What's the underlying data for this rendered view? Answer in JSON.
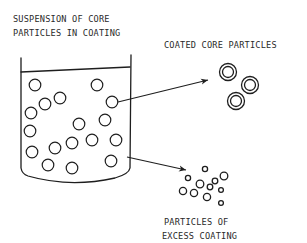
{
  "diagram": {
    "labels": {
      "suspension_line1": "SUSPENSION OF CORE",
      "suspension_line2": "PARTICLES IN COATING",
      "coated": "COATED CORE PARTICLES",
      "excess_line1": "PARTICLES OF",
      "excess_line2": "EXCESS COATING"
    },
    "colors": {
      "ink": "#1e1e1e",
      "background": "#ffffff"
    },
    "container": "beaker-with-suspension",
    "core_particle_count": 17,
    "coated_particle_count": 3,
    "excess_particle_count": 11,
    "arrows": [
      {
        "from": "core-particle-in-beaker",
        "to": "coated-core-particles"
      },
      {
        "from": "coating-liquid-in-beaker",
        "to": "particles-of-excess-coating"
      }
    ]
  }
}
